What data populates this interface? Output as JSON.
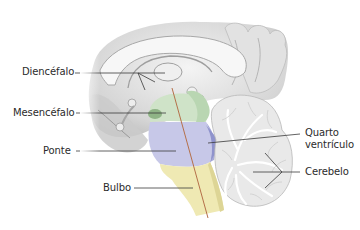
{
  "figure": {
    "colors": {
      "background": "#ffffff",
      "brain_gray": "#d9d9d9",
      "brain_shadow": "#a9a9a9",
      "mesencefalo_green": "#cfe3c8",
      "ponte_purple": "#c7c8e8",
      "bulbo_yellow": "#efe9b3",
      "ventricle_blue": "#8f93cc",
      "axis_line": "#b5704a",
      "leader_line": "#3a3a3a",
      "label_text": "#2b2b2b"
    }
  },
  "labels": {
    "diencefalo": "Diencéfalo",
    "mesencefalo": "Mesencéfalo",
    "ponte": "Ponte",
    "bulbo": "Bulbo",
    "quarto_ventriculo_line1": "Quarto",
    "quarto_ventriculo_line2": "ventrículo",
    "cerebelo": "Cerebelo"
  }
}
